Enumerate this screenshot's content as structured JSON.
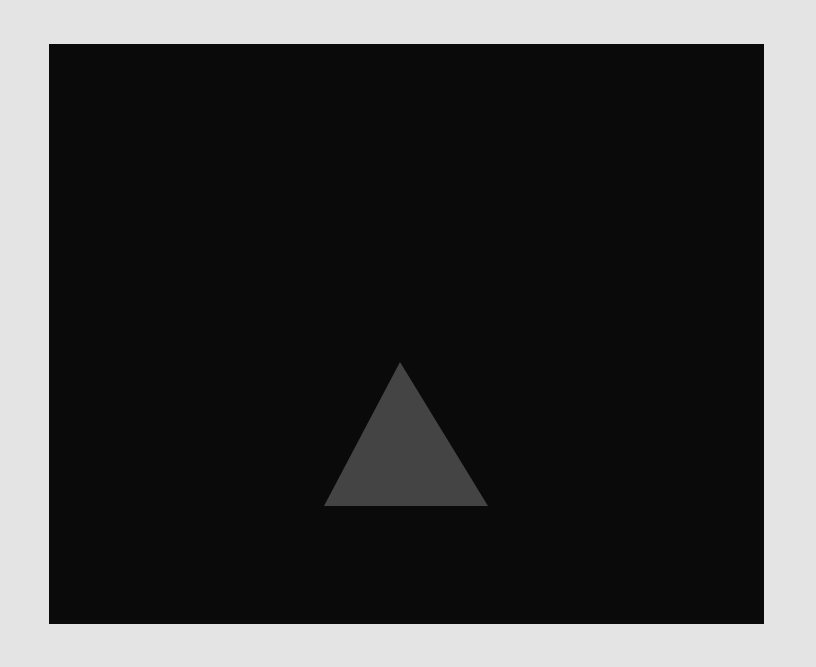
{
  "page": {
    "background_color": "#e4e4e4"
  },
  "canvas": {
    "background_color": "#0a0a0a",
    "x": 49,
    "y": 44,
    "width": 715,
    "height": 580
  },
  "scene": {
    "shapes": [
      {
        "type": "triangle",
        "fill": "#444444",
        "points_page": [
          [
            400,
            362
          ],
          [
            324,
            506
          ],
          [
            488,
            506
          ]
        ]
      }
    ]
  }
}
